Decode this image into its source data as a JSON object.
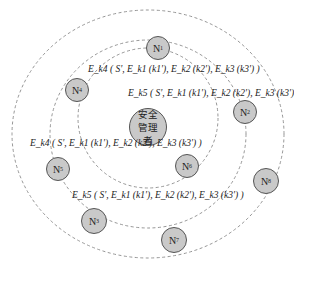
{
  "diagram": {
    "center_node": {
      "label": "安全管理者"
    },
    "nodes": [
      {
        "id": "N1",
        "label": "N",
        "sub": "1"
      },
      {
        "id": "N2",
        "label": "N",
        "sub": "2"
      },
      {
        "id": "N3",
        "label": "N",
        "sub": "3"
      },
      {
        "id": "N4",
        "label": "N",
        "sub": "4"
      },
      {
        "id": "N5",
        "label": "N",
        "sub": "5"
      },
      {
        "id": "N6",
        "label": "N",
        "sub": "6"
      },
      {
        "id": "N7",
        "label": "N",
        "sub": "7"
      },
      {
        "id": "N8",
        "label": "N",
        "sub": "8"
      }
    ],
    "formulas": [
      {
        "id": "f1",
        "text": "E_k4 ( S', E_k1 (k1'), E_k2 (k2'), E_k3 (k3') )"
      },
      {
        "id": "f2",
        "text": "E_k5 ( S', E_k1 (k1'), E_k2 (k2'), E_k3 (k3') )"
      },
      {
        "id": "f3",
        "text": "E_k4 ( S', E_k1 (k1'), E_k2 (k2'), E_k3 (k3') )"
      },
      {
        "id": "f4",
        "text": "E_k5 ( S', E_k1 (k1'), E_k2 (k2'), E_k3 (k3') )"
      }
    ],
    "rings": [
      "inner",
      "middle",
      "outer"
    ],
    "colors": {
      "node_fill": "#c9c9c9",
      "node_stroke": "#555555",
      "ring_stroke": "#8a8a8a"
    }
  }
}
